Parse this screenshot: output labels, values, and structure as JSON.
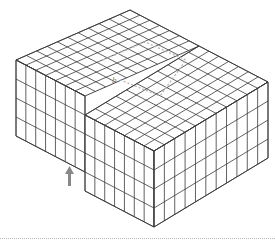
{
  "figure": {
    "burgers_vector_label": "b",
    "arrow": "up-arrow",
    "colors": {
      "lines": "#3a3a3a",
      "circuit": "#b8b8b8",
      "arrow": "#888888",
      "background": "#ffffff"
    },
    "lattice": {
      "depth_cells": 11,
      "width_cells": 14,
      "layers": 4
    }
  }
}
